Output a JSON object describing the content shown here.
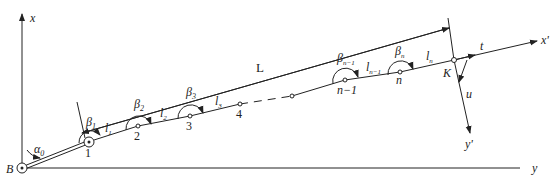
{
  "axes": {
    "x_label": "x",
    "y_label": "y",
    "x_prime_label": "x'",
    "y_prime_label": "y'",
    "origin_label": "B"
  },
  "angles": {
    "alpha0": "α",
    "alpha0_sub": "0",
    "beta1": "β",
    "beta1_sub": "1",
    "beta2": "β",
    "beta2_sub": "2",
    "beta3": "β",
    "beta3_sub": "3",
    "betan1": "β",
    "betan1_sub": "n−1",
    "betan": "β",
    "betan_sub": "n"
  },
  "lengths": {
    "l1": "l",
    "l1_sub": "1",
    "l2": "l",
    "l2_sub": "2",
    "l3": "l",
    "l3_sub": "3",
    "ln1": "l",
    "ln1_sub": "n−1",
    "ln": "l",
    "ln_sub": "n",
    "L": "L"
  },
  "points": {
    "p1": "1",
    "p2": "2",
    "p3": "3",
    "p4": "4",
    "pn1": "n−1",
    "pn": "n",
    "K": "K"
  },
  "vectors": {
    "t": "t",
    "u": "u"
  }
}
